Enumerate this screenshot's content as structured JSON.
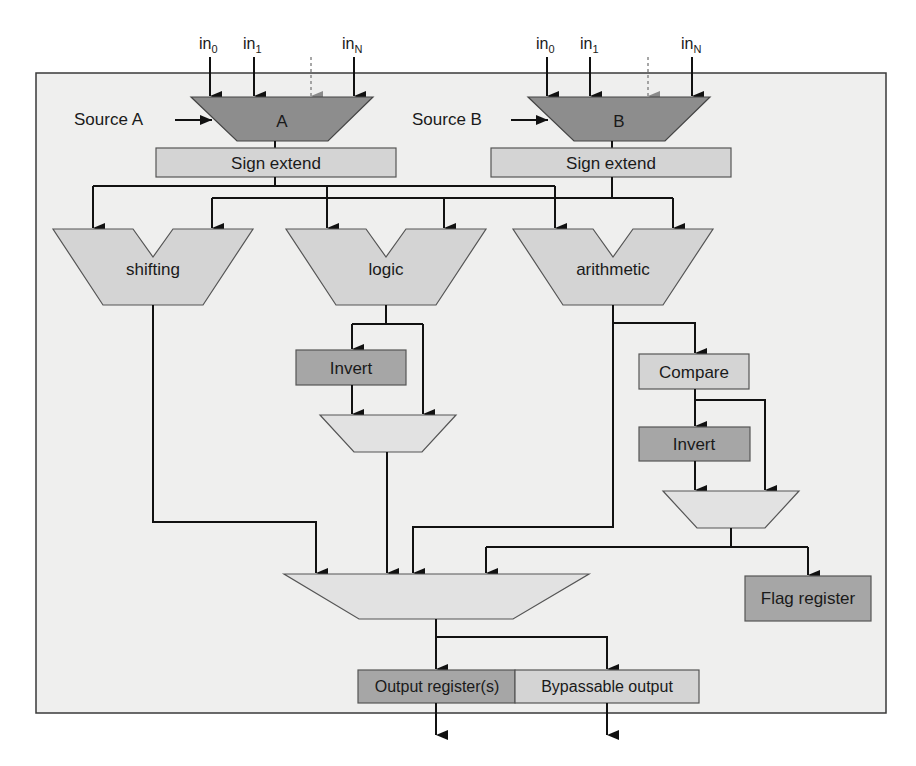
{
  "diagram": {
    "colors": {
      "frame_bg": "#efefee",
      "dark_fill": "#8d8d8d",
      "mid_fill": "#a6a6a6",
      "light_fill": "#d4d4d4",
      "pale_fill": "#e2e2e2",
      "wire": "#111111"
    },
    "inputs_a": {
      "in0": "in",
      "in0_sub": "0",
      "in1": "in",
      "in1_sub": "1",
      "inN": "in",
      "inN_sub": "N"
    },
    "inputs_b": {
      "in0": "in",
      "in0_sub": "0",
      "in1": "in",
      "in1_sub": "1",
      "inN": "in",
      "inN_sub": "N"
    },
    "source_a_label": "Source A",
    "source_b_label": "Source B",
    "mux_a_label": "A",
    "mux_b_label": "B",
    "sign_extend_a": "Sign extend",
    "sign_extend_b": "Sign extend",
    "units": {
      "shifting": "shifting",
      "logic": "logic",
      "arithmetic": "arithmetic"
    },
    "logic_invert": "Invert",
    "compare": "Compare",
    "compare_invert": "Invert",
    "flag_register": "Flag register",
    "output_register": "Output register(s)",
    "bypassable_output": "Bypassable output"
  }
}
